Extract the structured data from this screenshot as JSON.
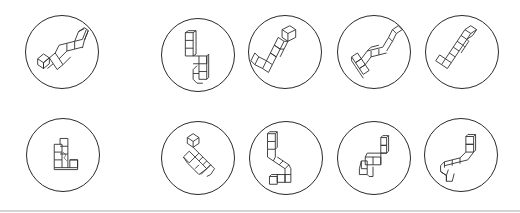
{
  "figure": {
    "colors": {
      "stroke": "#2a2a2a",
      "background": "#ffffff",
      "rule": "#d4d4d4"
    },
    "rows": [
      {
        "role": "row-1",
        "items": [
          {
            "id": "1-standard",
            "cx": 62,
            "cy": 52,
            "shape": "zigzag-diagonal"
          },
          {
            "id": "1-a",
            "cx": 198,
            "cy": 55,
            "shape": "vertical-s"
          },
          {
            "id": "1-b",
            "cx": 285,
            "cy": 52,
            "shape": "l-diagonal"
          },
          {
            "id": "1-c",
            "cx": 374,
            "cy": 52,
            "shape": "zigzag-diagonal"
          },
          {
            "id": "1-d",
            "cx": 462,
            "cy": 52,
            "shape": "l-diagonal-small"
          }
        ]
      },
      {
        "role": "row-2",
        "items": [
          {
            "id": "2-standard",
            "cx": 63,
            "cy": 155,
            "shape": "l-upright"
          },
          {
            "id": "2-a",
            "cx": 198,
            "cy": 158,
            "shape": "tilted-block"
          },
          {
            "id": "2-b",
            "cx": 286,
            "cy": 158,
            "shape": "vertical-s"
          },
          {
            "id": "2-c",
            "cx": 374,
            "cy": 158,
            "shape": "step-z"
          },
          {
            "id": "2-d",
            "cx": 461,
            "cy": 155,
            "shape": "hook"
          }
        ]
      }
    ]
  }
}
